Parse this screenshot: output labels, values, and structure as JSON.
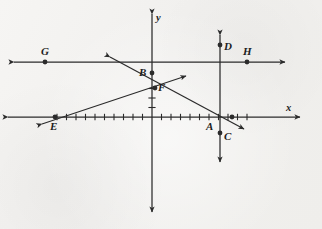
{
  "figure": {
    "kind": "coordinate-geometry-diagram",
    "background_color": "#f2f1ef",
    "ink_color": "#2b2b2b"
  },
  "axes": {
    "x_axis": {
      "label": "x",
      "origin_px": [
        152,
        117
      ],
      "left_end_px": [
        8,
        117
      ],
      "right_end_px": [
        300,
        117
      ],
      "arrows": "both"
    },
    "y_axis": {
      "label": "y",
      "top_end_px": [
        152,
        14
      ],
      "bottom_end_px": [
        152,
        212
      ],
      "arrows": "both"
    },
    "tick_spacing_px": 9.5,
    "x_ticks_left": 10,
    "x_ticks_right": 10,
    "y_ticks_up": 0,
    "y_ticks_down": 3
  },
  "points": [
    {
      "id": "A",
      "label": "A",
      "x": 210,
      "y": 117,
      "label_x": 206,
      "label_y": 121,
      "dot": false
    },
    {
      "id": "B",
      "label": "B",
      "x": 152,
      "y": 73,
      "label_x": 139,
      "label_y": 67,
      "dot": true
    },
    {
      "id": "C",
      "label": "C",
      "x": 220,
      "y": 133,
      "label_x": 224,
      "label_y": 131,
      "dot": true
    },
    {
      "id": "D",
      "label": "D",
      "x": 220,
      "y": 45,
      "label_x": 224,
      "label_y": 41,
      "dot": true
    },
    {
      "id": "E",
      "label": "E",
      "x": 55,
      "y": 117,
      "label_x": 50,
      "label_y": 121,
      "dot": true
    },
    {
      "id": "F",
      "label": "F",
      "x": 155,
      "y": 88,
      "label_x": 158,
      "label_y": 82,
      "dot": true
    },
    {
      "id": "G",
      "label": "G",
      "x": 45,
      "y": 62,
      "label_x": 41,
      "label_y": 46,
      "dot": true
    },
    {
      "id": "H",
      "label": "H",
      "x": 247,
      "y": 62,
      "label_x": 243,
      "label_y": 46,
      "dot": true
    },
    {
      "id": "I",
      "label": "",
      "x": 232,
      "y": 117,
      "label_x": 0,
      "label_y": 0,
      "dot": true
    }
  ],
  "lines": [
    {
      "id": "GH",
      "name": "horizontal-line-through-G-and-H",
      "from_px": [
        14,
        62
      ],
      "to_px": [
        285,
        62
      ],
      "arrows": "both"
    },
    {
      "id": "CD",
      "name": "vertical-line-through-C-and-D",
      "from_px": [
        220,
        35
      ],
      "to_px": [
        220,
        162
      ],
      "arrows": "both"
    },
    {
      "id": "BA",
      "name": "line-through-B-descending-right",
      "from_px": [
        110,
        57
      ],
      "to_px": [
        244,
        129
      ],
      "arrows": "both"
    },
    {
      "id": "EF",
      "name": "line-through-E-and-F-ascending",
      "from_px": [
        42,
        124
      ],
      "to_px": [
        186,
        76
      ],
      "arrows": "both"
    }
  ],
  "labels": {
    "x_axis": "x",
    "y_axis": "y",
    "A": "A",
    "B": "B",
    "C": "C",
    "D": "D",
    "E": "E",
    "F": "F",
    "G": "G",
    "H": "H"
  }
}
